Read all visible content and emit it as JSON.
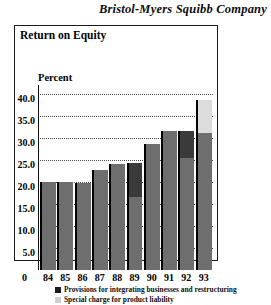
{
  "company": {
    "name": "Bristol-Myers Squibb Company"
  },
  "figure": {
    "title": "Return on Equity",
    "axis_label": "Percent",
    "zero_label": "0"
  },
  "legend": {
    "items": [
      {
        "swatch": "dark",
        "color": "#1c1c1c",
        "label": "Provisions for integrating businesses and restructuring"
      },
      {
        "swatch": "light",
        "color": "#cfcfcf",
        "label": "Special charge for product liability"
      }
    ]
  },
  "chart_data": {
    "type": "bar",
    "title": "Return on Equity",
    "subtitle": "",
    "xlabel": "",
    "ylabel": "Percent",
    "ylim": [
      0,
      42
    ],
    "grid": true,
    "grid_axis": "y",
    "legend_position": "below",
    "categories": [
      "84",
      "85",
      "86",
      "87",
      "88",
      "89",
      "90",
      "91",
      "92",
      "93"
    ],
    "ytick_labels": [
      "40.0",
      "35.0",
      "30.0",
      "25.0",
      "20.0",
      "15.0",
      "10.0",
      "5.0",
      "0"
    ],
    "ytick_values": [
      40.0,
      35.0,
      30.0,
      25.0,
      20.0,
      15.0,
      10.0,
      5.0,
      0
    ],
    "values": [
      20.0,
      20.0,
      19.8,
      22.7,
      24.0,
      24.3,
      28.5,
      31.5,
      31.5,
      38.5
    ],
    "series": [
      {
        "name": "Return on equity",
        "color": "#6e6e6e",
        "values": [
          20.0,
          20.0,
          19.8,
          22.7,
          24.0,
          16.5,
          28.5,
          31.5,
          25.5,
          31.0
        ]
      },
      {
        "name": "Provisions for integrating businesses and restructuring",
        "color": "#3a3a3a",
        "values": [
          0,
          0,
          0,
          0,
          0,
          7.8,
          0,
          0,
          6.0,
          0
        ]
      },
      {
        "name": "Special charge for product liability",
        "color": "#dcdcdc",
        "values": [
          0,
          0,
          0,
          0,
          0,
          0,
          0,
          0,
          0,
          7.5
        ]
      }
    ]
  }
}
